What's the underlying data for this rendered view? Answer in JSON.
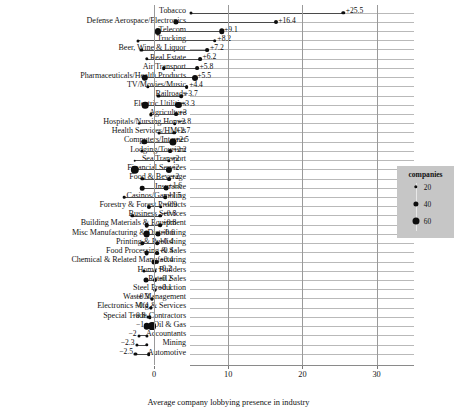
{
  "chart_data": {
    "type": "scatter",
    "title": "",
    "xlabel": "Average company lobbying presence in industry",
    "ylabel": "",
    "xlim": [
      -4.2,
      32
    ],
    "xticks": [
      0,
      10,
      20,
      30
    ],
    "xtick_labels": [
      "0",
      "10",
      "20",
      "30"
    ],
    "grid": true,
    "legend": {
      "title": "companies",
      "position": "right",
      "entries": [
        {
          "label": "20",
          "size": 20
        },
        {
          "label": "40",
          "size": 40
        },
        {
          "label": "60",
          "size": 60
        }
      ]
    },
    "series": [
      {
        "name": "start",
        "marker": "circle",
        "size_encodes": "companies"
      },
      {
        "name": "end",
        "marker": "circle",
        "size_encodes": "companies"
      }
    ],
    "categories": [
      "Tobacco",
      "Defense Aerospace/Electronics",
      "Telecom",
      "Trucking",
      "Beer, Wine & Liquor",
      "Real Estate",
      "Air Transport",
      "Pharmaceuticals/Health Products",
      "TV/Movies/Music",
      "Railroads",
      "Electric Utilities",
      "Agriculture",
      "Hospitals/Nursing Homes",
      "Health Services/HMOs",
      "Computers/Internet",
      "Lodging/Tourism",
      "Sea Transport",
      "Financial Services",
      "Food & Beverage",
      "Insurance",
      "Casinos/Gambling",
      "Forestry & Forest Products",
      "Business Services",
      "Building Materials & Equipment",
      "Misc Manufacturing & Distributing",
      "Printing & Publishing",
      "Food Processing & Sales",
      "Chemical & Related Manufacturing",
      "Home Builders",
      "Retail Sales",
      "Steel Production",
      "Waste Management",
      "Electronics Mfg & Services",
      "Special Trade Contractors",
      "Oil & Gas",
      "Accountants",
      "Mining",
      "Automotive"
    ],
    "rows": [
      {
        "category": "Tobacco",
        "start": 5.0,
        "end": 25.5,
        "label": "+25.5",
        "label_side": "right",
        "start_size": 3.0,
        "end_size": 3.4
      },
      {
        "category": "Defense Aerospace/Electronics",
        "start": 2.9,
        "end": 16.4,
        "label": "+16.4",
        "label_side": "right",
        "start_size": 5.2,
        "end_size": 4.0
      },
      {
        "category": "Telecom",
        "start": 0.5,
        "end": 9.1,
        "label": "+9.1",
        "label_side": "right",
        "start_size": 6.2,
        "end_size": 5.4
      },
      {
        "category": "Trucking",
        "start": -2.2,
        "end": 8.2,
        "label": "+8.2",
        "label_side": "right",
        "start_size": 3.0,
        "end_size": 3.6
      },
      {
        "category": "Beer, Wine & Liquor",
        "start": -1.7,
        "end": 7.2,
        "label": "+7.2",
        "label_side": "right",
        "start_size": 3.2,
        "end_size": 3.8
      },
      {
        "category": "Real Estate",
        "start": -1.0,
        "end": 6.2,
        "label": "+6.2",
        "label_side": "right",
        "start_size": 3.4,
        "end_size": 3.8
      },
      {
        "category": "Air Transport",
        "start": 1.3,
        "end": 5.8,
        "label": "+5.8",
        "label_side": "right",
        "start_size": 3.6,
        "end_size": 3.8
      },
      {
        "category": "Pharmaceuticals/Health Products",
        "start": -1.2,
        "end": 5.5,
        "label": "+5.5",
        "label_side": "right",
        "start_size": 6.4,
        "end_size": 6.0
      },
      {
        "category": "TV/Movies/Music",
        "start": -0.8,
        "end": 4.4,
        "label": "+4.4",
        "label_side": "right",
        "start_size": 3.4,
        "end_size": 3.8
      },
      {
        "category": "Railroads",
        "start": 0.6,
        "end": 3.7,
        "label": "+3.7",
        "label_side": "right",
        "start_size": 3.2,
        "end_size": 3.6
      },
      {
        "category": "Electric Utilities",
        "start": -1.2,
        "end": 3.3,
        "label": "+3.3",
        "label_side": "right",
        "start_size": 6.6,
        "end_size": 6.2
      },
      {
        "category": "Agriculture",
        "start": -0.4,
        "end": 3.0,
        "label": "+3",
        "label_side": "right",
        "start_size": 3.2,
        "end_size": 3.8
      },
      {
        "category": "Hospitals/Nursing Homes",
        "start": -2.0,
        "end": 2.8,
        "label": "+2.8",
        "label_side": "right",
        "start_size": 2.8,
        "end_size": 3.6
      },
      {
        "category": "Health Services/HMOs",
        "start": 0.7,
        "end": 2.7,
        "label": "+2.7",
        "label_side": "right",
        "start_size": 3.0,
        "end_size": 3.6
      },
      {
        "category": "Computers/Internet",
        "start": -1.3,
        "end": 2.5,
        "label": "+2.5",
        "label_side": "right",
        "start_size": 5.4,
        "end_size": 7.2
      },
      {
        "category": "Lodging/Tourism",
        "start": -1.6,
        "end": 2.2,
        "label": "+2.2",
        "label_side": "right",
        "start_size": 3.0,
        "end_size": 3.8
      },
      {
        "category": "Sea Transport",
        "start": -2.6,
        "end": 2.0,
        "label": "+2",
        "label_side": "right",
        "start_size": 2.6,
        "end_size": 3.4
      },
      {
        "category": "Financial Services",
        "start": -2.6,
        "end": 2.0,
        "label": "+2",
        "label_side": "right",
        "start_size": 8.4,
        "end_size": 6.2
      },
      {
        "category": "Food & Beverage",
        "start": -1.6,
        "end": 2.0,
        "label": "+2",
        "label_side": "right",
        "start_size": 3.4,
        "end_size": 3.8
      },
      {
        "category": "Insurance",
        "start": -1.6,
        "end": 1.6,
        "label": "+1.6",
        "label_side": "right",
        "start_size": 4.6,
        "end_size": 4.8
      },
      {
        "category": "Casinos/Gambling",
        "start": -4.0,
        "end": 1.5,
        "label": "+1.5",
        "label_side": "right",
        "start_size": 2.6,
        "end_size": 3.6
      },
      {
        "category": "Forestry & Forest Products",
        "start": -0.7,
        "end": 0.9,
        "label": "+0.9",
        "label_side": "right",
        "start_size": 4.2,
        "end_size": 3.6
      },
      {
        "category": "Business Services",
        "start": -2.9,
        "end": 0.8,
        "label": "+0.8",
        "label_side": "right",
        "start_size": 3.4,
        "end_size": 3.6
      },
      {
        "category": "Building Materials & Equipment",
        "start": -1.0,
        "end": 0.8,
        "label": "+0.8",
        "label_side": "right",
        "start_size": 4.6,
        "end_size": 3.6
      },
      {
        "category": "Misc Manufacturing & Distributing",
        "start": -1.0,
        "end": 0.6,
        "label": "+0.6",
        "label_side": "right",
        "start_size": 6.8,
        "end_size": 5.0
      },
      {
        "category": "Printing & Publishing",
        "start": -1.6,
        "end": 0.4,
        "label": "+0.4",
        "label_side": "right",
        "start_size": 3.4,
        "end_size": 3.6
      },
      {
        "category": "Food Processing & Sales",
        "start": -1.0,
        "end": 0.4,
        "label": "+0.4",
        "label_side": "right",
        "start_size": 4.8,
        "end_size": 3.8
      },
      {
        "category": "Chemical & Related Manufacturing",
        "start": 0.0,
        "end": 0.4,
        "label": "+0.4",
        "label_side": "right",
        "start_size": 5.0,
        "end_size": 4.2
      },
      {
        "category": "Home Builders",
        "start": -1.3,
        "end": 0.2,
        "label": "+0.2",
        "label_side": "right",
        "start_size": 3.0,
        "end_size": 3.0
      },
      {
        "category": "Retail Sales",
        "start": -1.1,
        "end": 0.2,
        "label": "+0.2",
        "label_side": "right",
        "start_size": 5.0,
        "end_size": 4.0
      },
      {
        "category": "Steel Production",
        "start": 0.2,
        "end": 0.1,
        "label": "+0.1",
        "label_side": "right",
        "start_size": 3.0,
        "end_size": 3.2
      },
      {
        "category": "Waste Management",
        "start": -0.3,
        "end": -0.3,
        "label": "−0.3",
        "label_side": "left",
        "start_size": 3.2,
        "end_size": 3.0
      },
      {
        "category": "Electronics Mfg & Services",
        "start": -0.4,
        "end": -0.4,
        "label": "−0.4",
        "label_side": "left",
        "start_size": 3.4,
        "end_size": 3.2
      },
      {
        "category": "Special Trade Contractors",
        "start": -0.8,
        "end": -0.6,
        "label": "−0.8",
        "label_side": "left",
        "start_size": 3.2,
        "end_size": 3.4
      },
      {
        "category": "Oil & Gas",
        "start": -1.0,
        "end": -0.3,
        "label": "−1",
        "label_side": "left",
        "start_size": 6.6,
        "end_size": 7.8
      },
      {
        "category": "Accountants",
        "start": -2.0,
        "end": -1.0,
        "label": "−2",
        "label_side": "left",
        "start_size": 3.0,
        "end_size": 3.2
      },
      {
        "category": "Mining",
        "start": -2.3,
        "end": -1.0,
        "label": "−2.3",
        "label_side": "left",
        "start_size": 3.2,
        "end_size": 3.4
      },
      {
        "category": "Automotive",
        "start": -2.5,
        "end": -0.7,
        "label": "−2.5",
        "label_side": "left",
        "start_size": 3.2,
        "end_size": 3.6
      }
    ]
  }
}
